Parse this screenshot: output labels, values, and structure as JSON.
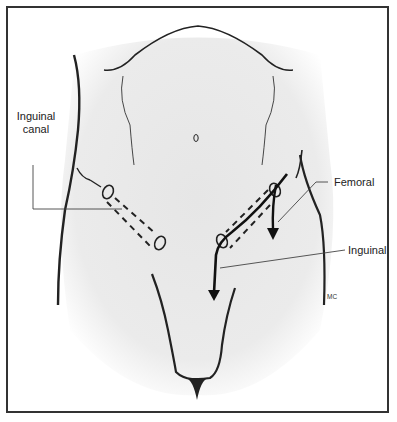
{
  "figure": {
    "title": "",
    "labels": {
      "inguinal_canal_line1": "Inguinal",
      "inguinal_canal_line2": "canal",
      "femoral": "Femoral",
      "inguinal": "Inguinal",
      "credit": "MC"
    },
    "colors": {
      "skin_fill": "#ebebeb",
      "outline": "#222222",
      "frame": "#333333"
    }
  }
}
